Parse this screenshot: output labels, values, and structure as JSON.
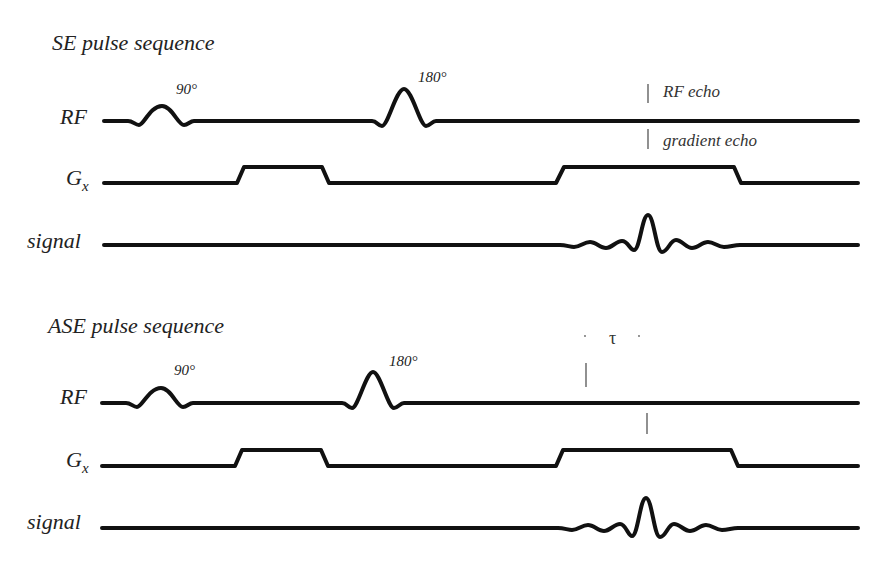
{
  "diagram": {
    "panels": [
      {
        "title": "SE pulse sequence",
        "rows": {
          "rf": {
            "label": "RF",
            "pulse1": "90°",
            "pulse2": "180°"
          },
          "gx": {
            "label": "G",
            "subscript": "x"
          },
          "signal": {
            "label": "signal"
          }
        },
        "annotations": {
          "rf_echo": "RF echo",
          "gradient_echo": "gradient echo"
        }
      },
      {
        "title": "ASE pulse sequence",
        "rows": {
          "rf": {
            "label": "RF",
            "pulse1": "90°",
            "pulse2": "180°"
          },
          "gx": {
            "label": "G",
            "subscript": "x"
          },
          "signal": {
            "label": "signal"
          }
        },
        "annotations": {
          "tau": "τ"
        }
      }
    ]
  }
}
